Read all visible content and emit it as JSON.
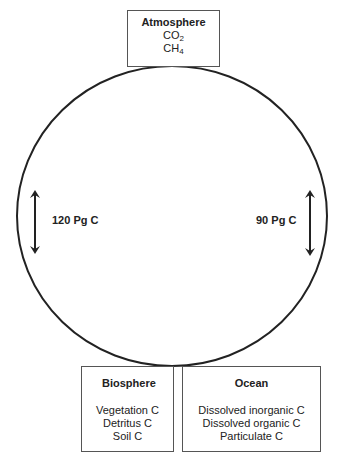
{
  "diagram": {
    "reservoirs": {
      "atmosphere": {
        "title": "Atmosphere",
        "items": [
          {
            "base": "CO",
            "sub": "2"
          },
          {
            "base": "CH",
            "sub": "4"
          }
        ]
      },
      "biosphere": {
        "title": "Biosphere",
        "items": [
          "Vegetation C",
          "Detritus C",
          "Soil C"
        ]
      },
      "ocean": {
        "title": "Ocean",
        "items": [
          "Dissolved inorganic C",
          "Dissolved organic C",
          "Particulate C"
        ]
      }
    },
    "fluxes": [
      {
        "side": "left",
        "label": "120 Pg C",
        "direction": "bidirectional"
      },
      {
        "side": "right",
        "label": "90 Pg C",
        "direction": "bidirectional"
      }
    ],
    "colors": {
      "line": "#222222",
      "box_border": "#555555",
      "background": "#ffffff"
    }
  }
}
